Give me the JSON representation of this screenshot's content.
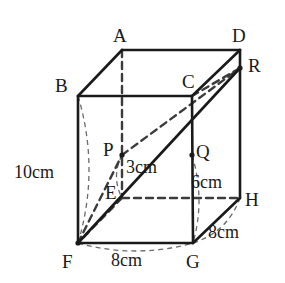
{
  "figure": {
    "type": "geometry-diagram",
    "shape": "rectangular-prism",
    "title": "",
    "vertices": [
      {
        "name": "A",
        "label": "A",
        "x": 122,
        "y": 50,
        "label_x": 113,
        "label_y": 26
      },
      {
        "name": "B",
        "label": "B",
        "x": 78,
        "y": 96,
        "label_x": 55,
        "label_y": 76
      },
      {
        "name": "C",
        "label": "C",
        "x": 192,
        "y": 96,
        "label_x": 182,
        "label_y": 72
      },
      {
        "name": "D",
        "label": "D",
        "x": 240,
        "y": 50,
        "label_x": 232,
        "label_y": 26
      },
      {
        "name": "E",
        "label": "E",
        "x": 122,
        "y": 198,
        "label_x": 105,
        "label_y": 183
      },
      {
        "name": "F",
        "label": "F",
        "x": 78,
        "y": 243,
        "label_x": 62,
        "label_y": 252
      },
      {
        "name": "G",
        "label": "G",
        "x": 193,
        "y": 243,
        "label_x": 186,
        "label_y": 252
      },
      {
        "name": "H",
        "label": "H",
        "x": 240,
        "y": 198,
        "label_x": 245,
        "label_y": 190
      },
      {
        "name": "P",
        "label": "P",
        "x": 122,
        "y": 155,
        "label_x": 103,
        "label_y": 140
      },
      {
        "name": "Q",
        "label": "Q",
        "x": 192,
        "y": 155,
        "label_x": 196,
        "label_y": 142
      },
      {
        "name": "R",
        "label": "R",
        "x": 240,
        "y": 68,
        "label_x": 248,
        "label_y": 56
      }
    ],
    "dimensions": [
      {
        "name": "height-BF",
        "label": "10cm",
        "x": 14,
        "y": 163
      },
      {
        "name": "segment-PE",
        "label": "3cm",
        "x": 126,
        "y": 158
      },
      {
        "name": "segment-QG",
        "label": "6cm",
        "x": 191,
        "y": 173
      },
      {
        "name": "depth-GH",
        "label": "8cm",
        "x": 208,
        "y": 223
      },
      {
        "name": "width-FG",
        "label": "8cm",
        "x": 111,
        "y": 251
      }
    ],
    "edges_solid": [
      {
        "name": "edge-B-A",
        "from": "B",
        "to": "A"
      },
      {
        "name": "edge-A-D",
        "from": "A",
        "to": "D"
      },
      {
        "name": "edge-D-C",
        "from": "D",
        "to": "C"
      },
      {
        "name": "edge-C-B",
        "from": "C",
        "to": "B"
      },
      {
        "name": "edge-B-F",
        "from": "B",
        "to": "F"
      },
      {
        "name": "edge-C-G",
        "from": "C",
        "to": "G"
      },
      {
        "name": "edge-D-H",
        "from": "D",
        "to": "H"
      },
      {
        "name": "edge-F-G",
        "from": "F",
        "to": "G"
      },
      {
        "name": "edge-G-H",
        "from": "G",
        "to": "H"
      },
      {
        "name": "line-F-R",
        "from": "F",
        "to": "R"
      }
    ],
    "edges_dashed": [
      {
        "name": "edge-A-E",
        "from": "A",
        "to": "E"
      },
      {
        "name": "edge-E-F",
        "from": "E",
        "to": "F"
      },
      {
        "name": "edge-E-H",
        "from": "E",
        "to": "H"
      },
      {
        "name": "line-C-R",
        "from": "C",
        "to": "R"
      },
      {
        "name": "line-F-P",
        "from": "F",
        "to": "P"
      },
      {
        "name": "line-P-R",
        "from": "P",
        "to": "R"
      }
    ],
    "measure_arcs": [
      {
        "name": "arc-BF-10cm",
        "from": "B",
        "to": "F",
        "bulge": -22
      },
      {
        "name": "arc-FG-8cm",
        "from": "F",
        "to": "G",
        "bulge": 16
      },
      {
        "name": "arc-GH-8cm",
        "from": "G",
        "to": "H",
        "bulge": 16
      },
      {
        "name": "arc-QG-6cm",
        "from": "Q",
        "to": "G",
        "bulge": -13
      },
      {
        "name": "arc-PE-3cm",
        "from": "P",
        "to": "E",
        "bulge": 11
      }
    ],
    "colors": {
      "stroke": "#1a1a1a",
      "dash": "#3c3c3c",
      "arc": "#6b6b6b",
      "background": "#ffffff"
    }
  }
}
